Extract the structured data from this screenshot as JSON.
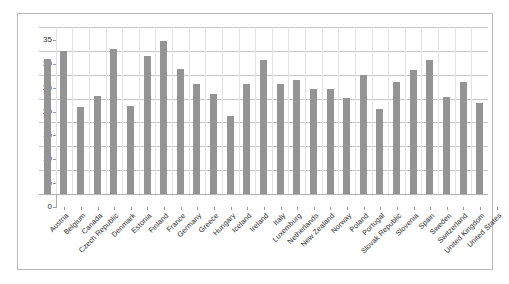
{
  "chart_data": {
    "type": "bar",
    "title": "",
    "subtitle": "",
    "xlabel": "",
    "ylabel": "",
    "ylim": [
      0,
      35
    ],
    "ytick_labels": [
      "0",
      "5",
      "10",
      "15",
      "20",
      "25",
      "30",
      "35"
    ],
    "ytick_values": [
      0,
      5,
      10,
      15,
      20,
      25,
      30,
      35
    ],
    "grid": true,
    "legend": "none",
    "bar_color": "#949494",
    "gridline_color": "#c6c6c6",
    "frame_color": "#b9b9b9",
    "categories": [
      "Austria",
      "Belgium",
      "Canada",
      "Czech Republic",
      "Denmark",
      "Estonia",
      "Finland",
      "France",
      "Germany",
      "Greece",
      "Hungary",
      "Iceland",
      "Ireland",
      "Italy",
      "Luxemburg",
      "Netherlands",
      "New Zealand",
      "Norway",
      "Poland",
      "Portugal",
      "Slovak Republic",
      "Slovenia",
      "Spain",
      "Sweden",
      "Switzerland",
      "United Kingdom",
      "United States"
    ],
    "values": [
      28.2,
      30.0,
      18.2,
      20.5,
      30.4,
      18.4,
      29.0,
      32.0,
      26.2,
      23.0,
      21.0,
      16.3,
      23.0,
      28.0,
      23.0,
      24.0,
      22.0,
      22.0,
      20.2,
      25.0,
      17.8,
      23.5,
      26.0,
      28.0,
      20.3,
      23.5,
      19.0
    ]
  }
}
